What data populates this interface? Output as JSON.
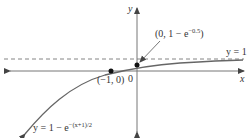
{
  "figure": {
    "axes": {
      "x_label": "x",
      "y_label": "y",
      "origin_label": "0"
    },
    "asymptote": {
      "label": "y = 1",
      "style": "dashed",
      "y": 1
    },
    "curve": {
      "equation_prefix": "y = 1 − e",
      "equation_exponent": "−(x+1)/2"
    },
    "points": [
      {
        "label": "(−1, 0)",
        "x": -1,
        "y": 0
      },
      {
        "label_prefix": "(0, 1 − e",
        "label_exponent": "−0.5",
        "label_suffix": ")",
        "x": 0,
        "y": 0.3935
      }
    ],
    "colors": {
      "curve": "#666666",
      "axes": "#555555",
      "asymptote": "#666666",
      "points": "#111111"
    }
  }
}
